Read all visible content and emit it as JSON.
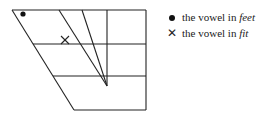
{
  "diagram": {
    "type": "vowel-quadrilateral",
    "markers": [
      {
        "symbol": "dot",
        "meaning": "the vowel in feet"
      },
      {
        "symbol": "cross",
        "meaning": "the vowel in fit"
      }
    ]
  },
  "legend": {
    "items": [
      {
        "symbol_name": "dot-icon",
        "prefix": "the vowel in ",
        "word": "feet"
      },
      {
        "symbol_name": "cross-icon",
        "prefix": "the vowel in ",
        "word": "fit"
      }
    ]
  },
  "colors": {
    "ink": "#111111",
    "background": "#ffffff"
  }
}
